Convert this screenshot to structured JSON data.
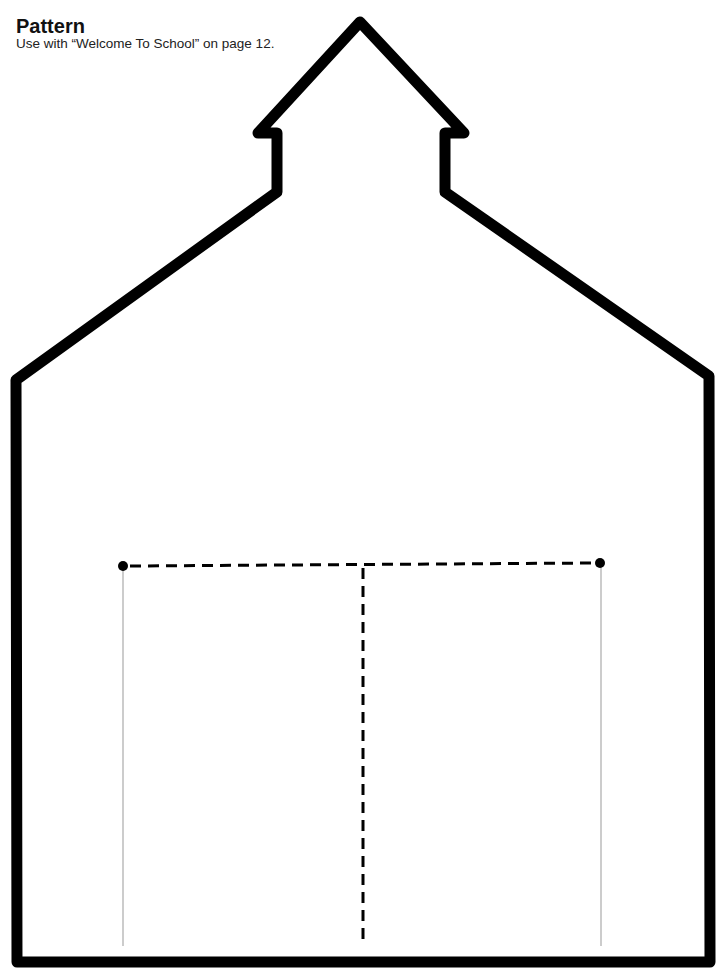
{
  "header": {
    "title": "Pattern",
    "subtitle": "Use with “Welcome To School” on page 12."
  },
  "pattern": {
    "shape": "schoolhouse-outline",
    "outline_color": "#000000",
    "fold_line_color": "#000000",
    "guide_line_color": "#999999"
  }
}
